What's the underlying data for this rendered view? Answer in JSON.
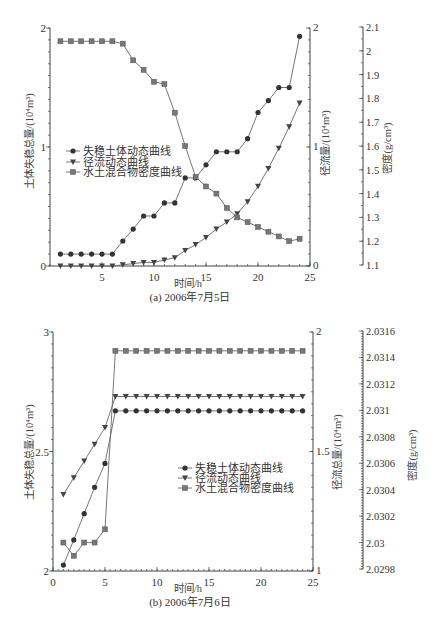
{
  "chart_data": [
    {
      "type": "line",
      "title": "(a) 2006年7月5日",
      "xlabel": "时间/h",
      "ylabel_left": "土体失稳总量/(10⁴m³)",
      "ylabel_right": "径流量/(10⁴m³)",
      "ylabel_density": "密度(g/cm³)",
      "xlim": [
        0,
        25
      ],
      "ylim_left": [
        0,
        2
      ],
      "ylim_right": [
        0,
        2
      ],
      "ylim_density": [
        1.1,
        2.1
      ],
      "x_ticks": {
        "values": [
          5,
          10,
          15,
          20,
          25
        ],
        "labels": [
          "5",
          "10",
          "15",
          "20",
          "25"
        ]
      },
      "left_ticks": {
        "values": [
          0,
          1,
          2
        ],
        "labels": [
          "0",
          "1",
          "2"
        ]
      },
      "right_ticks": {
        "values": [
          0,
          1,
          2
        ],
        "labels": [
          "0",
          "1",
          "2"
        ]
      },
      "density_ticks": {
        "values": [
          1.1,
          1.2,
          1.3,
          1.4,
          1.5,
          1.6,
          1.7,
          1.8,
          1.9,
          2.0,
          2.1
        ],
        "labels": [
          "1.1",
          "1.2",
          "1.3",
          "1.4",
          "1.5",
          "1.6",
          "1.7",
          "1.8",
          "1.9",
          "2",
          "2.1"
        ]
      },
      "grid": false,
      "legend_position": "upper-left",
      "x": [
        1,
        2,
        3,
        4,
        5,
        6,
        7,
        8,
        9,
        10,
        11,
        12,
        13,
        14,
        15,
        16,
        17,
        18,
        19,
        20,
        21,
        22,
        23,
        24
      ],
      "series": [
        {
          "name": "失稳土体动态曲线",
          "axis": "left",
          "marker": "circle",
          "values": [
            0.1,
            0.1,
            0.1,
            0.1,
            0.1,
            0.1,
            0.21,
            0.31,
            0.42,
            0.42,
            0.53,
            0.53,
            0.74,
            0.74,
            0.85,
            0.96,
            0.96,
            0.96,
            1.07,
            1.29,
            1.39,
            1.5,
            1.5,
            1.93
          ]
        },
        {
          "name": "径流动态曲线",
          "axis": "right",
          "marker": "triangle-down",
          "values": [
            0,
            0,
            0,
            0,
            0,
            0,
            0.01,
            0.02,
            0.03,
            0.03,
            0.05,
            0.07,
            0.13,
            0.18,
            0.24,
            0.31,
            0.37,
            0.44,
            0.54,
            0.67,
            0.82,
            0.99,
            1.17,
            1.37
          ]
        },
        {
          "name": "水土混合物密度曲线",
          "axis": "density",
          "marker": "square",
          "values": [
            2.04,
            2.04,
            2.04,
            2.04,
            2.04,
            2.04,
            2.03,
            1.96,
            1.92,
            1.87,
            1.86,
            1.74,
            1.6,
            1.47,
            1.43,
            1.4,
            1.34,
            1.3,
            1.28,
            1.26,
            1.24,
            1.22,
            1.2,
            1.21
          ]
        }
      ]
    },
    {
      "type": "line",
      "title": "(b) 2006年7月6日",
      "xlabel": "时间/h",
      "ylabel_left": "土体失稳总量/(10⁴m³)",
      "ylabel_right": "径流总量/(10⁴m³)",
      "ylabel_density": "密度(g/cm³)",
      "xlim": [
        0,
        25
      ],
      "ylim_left": [
        2,
        3
      ],
      "ylim_right": [
        1,
        2
      ],
      "ylim_density": [
        2.0298,
        2.0316
      ],
      "x_ticks": {
        "values": [
          0,
          5,
          10,
          15,
          20,
          25
        ],
        "labels": [
          "0",
          "5",
          "10",
          "15",
          "20",
          "25"
        ]
      },
      "left_ticks": {
        "values": [
          2,
          2.5,
          3
        ],
        "labels": [
          "2",
          "2.5",
          "3"
        ]
      },
      "right_ticks": {
        "values": [
          1,
          1.5,
          2
        ],
        "labels": [
          "1",
          "1.5",
          "2"
        ]
      },
      "density_ticks": {
        "values": [
          2.0298,
          2.03,
          2.0302,
          2.0304,
          2.0306,
          2.0308,
          2.031,
          2.0312,
          2.0314,
          2.0316
        ],
        "labels": [
          "2.0298",
          "2.03",
          "2.0302",
          "2.0304",
          "2.0306",
          "2.0308",
          "2.031",
          "2.0312",
          "2.0314",
          "2.0316"
        ]
      },
      "grid": false,
      "legend_position": "center-right",
      "x": [
        1,
        2,
        3,
        4,
        5,
        6,
        7,
        8,
        9,
        10,
        11,
        12,
        13,
        14,
        15,
        16,
        17,
        18,
        19,
        20,
        21,
        22,
        23,
        24
      ],
      "series": [
        {
          "name": "失稳土体动态曲线",
          "axis": "left",
          "marker": "circle",
          "values": [
            2.025,
            2.13,
            2.24,
            2.35,
            2.45,
            2.67,
            2.67,
            2.67,
            2.67,
            2.67,
            2.67,
            2.67,
            2.67,
            2.67,
            2.67,
            2.67,
            2.67,
            2.67,
            2.67,
            2.67,
            2.67,
            2.67,
            2.67,
            2.67
          ]
        },
        {
          "name": "径流动态曲线",
          "axis": "right",
          "marker": "triangle-down",
          "values": [
            1.32,
            1.39,
            1.46,
            1.53,
            1.6,
            1.73,
            1.73,
            1.73,
            1.73,
            1.73,
            1.73,
            1.73,
            1.73,
            1.73,
            1.73,
            1.73,
            1.73,
            1.73,
            1.73,
            1.73,
            1.73,
            1.73,
            1.73,
            1.73
          ]
        },
        {
          "name": "水土混合物密度曲线",
          "axis": "density",
          "marker": "square",
          "values": [
            2.03,
            2.0299,
            2.03,
            2.03,
            2.0301,
            2.03145,
            2.03145,
            2.03145,
            2.03145,
            2.03145,
            2.03145,
            2.03145,
            2.03145,
            2.03145,
            2.03145,
            2.03145,
            2.03145,
            2.03145,
            2.03145,
            2.03145,
            2.03145,
            2.03145,
            2.03145,
            2.03145
          ]
        }
      ]
    }
  ]
}
